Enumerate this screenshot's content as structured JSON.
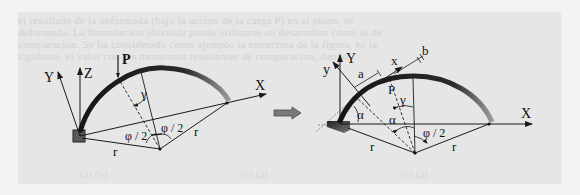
{
  "figure": {
    "background_color": "#f3f3f3",
    "panel_color": "#e6e6e6",
    "bleed_through_text": [
      "el resultado de la deformada (bajo la accion de la carga P) en el plano, se",
      "deformada. La formulacion obtenida puede utilizarse en desarrollos como la de",
      "comparacion. Se ha considerado como ejemplo la estructura de la figura, en la",
      "siguiente, el valor con los momentos resultantes de comparacion, dando"
    ],
    "bleed_bottom_text": [
      "(a) (b)",
      "(b) (a)",
      "(b) (a)"
    ],
    "left_diagram": {
      "title": "global-coordinate-arch",
      "labels": {
        "load": "P",
        "axis_x": "X",
        "axis_y": "Y",
        "axis_z": "Z",
        "angle_gamma": "γ",
        "half_angle_left": "φ / 2",
        "half_angle_right": "φ / 2",
        "radius_left": "r",
        "radius_right": "r"
      }
    },
    "transition_arrow": {
      "icon": "right-arrow-icon",
      "color": "#6a6a6a"
    },
    "right_diagram": {
      "title": "local-coordinate-arch",
      "labels": {
        "load": "P",
        "axis_X": "X",
        "axis_Y": "Y",
        "local_x": "x",
        "local_y": "y",
        "dim_a": "a",
        "dim_b": "b",
        "angle_gamma": "γ",
        "angle_alpha_support": "α",
        "angle_alpha_center": "α",
        "half_angle": "φ / 2",
        "radius_left": "r",
        "radius_right": "r"
      }
    },
    "colors": {
      "line": "#1a1a1a",
      "arch": "#1c1c1c",
      "arch_end": "#8a8a8a",
      "support": "#3a3a3a"
    }
  }
}
